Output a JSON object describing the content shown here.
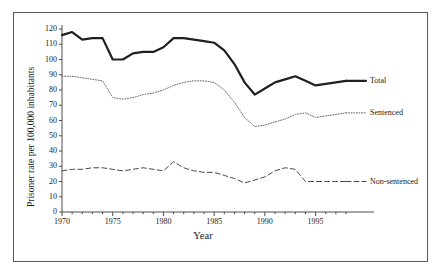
{
  "chart_data": {
    "type": "line",
    "title": "",
    "xlabel": "Year",
    "ylabel": "Prisoner rate per 100,000 inhabitants",
    "xlim": [
      1970,
      1998
    ],
    "ylim": [
      0,
      120
    ],
    "xticks": [
      1970,
      1975,
      1980,
      1985,
      1990,
      1995
    ],
    "yticks": [
      0,
      10,
      20,
      30,
      40,
      50,
      60,
      70,
      80,
      90,
      100,
      110,
      120
    ],
    "grid": false,
    "legend_position": "right-inline",
    "x": [
      1970,
      1971,
      1972,
      1973,
      1974,
      1975,
      1976,
      1977,
      1978,
      1979,
      1980,
      1981,
      1982,
      1983,
      1984,
      1985,
      1986,
      1987,
      1988,
      1989,
      1990,
      1991,
      1992,
      1993,
      1994,
      1995,
      1996,
      1997,
      1998
    ],
    "series": [
      {
        "name": "Total",
        "style": "solid-thick",
        "color": "#1f1f1f",
        "values": [
          116,
          118,
          113,
          114,
          114,
          100,
          100,
          104,
          105,
          105,
          108,
          114,
          114,
          113,
          112,
          111,
          106,
          97,
          85,
          77,
          81,
          85,
          87,
          89,
          86,
          83,
          84,
          85,
          86
        ]
      },
      {
        "name": "Sentenced",
        "style": "dotted",
        "color": "#6b6b6b",
        "values": [
          89,
          89,
          88,
          87,
          86,
          75,
          74,
          75,
          77,
          78,
          80,
          83,
          85,
          86,
          86,
          85,
          80,
          72,
          62,
          56,
          57,
          59,
          61,
          64,
          65,
          62,
          63,
          64,
          65
        ]
      },
      {
        "name": "Non-sentenced",
        "style": "dashed",
        "color": "#4a4a4a",
        "values": [
          27,
          28,
          28,
          29,
          29,
          28,
          27,
          28,
          29,
          28,
          27,
          33,
          29,
          27,
          26,
          26,
          24,
          22,
          19,
          21,
          23,
          27,
          29,
          28,
          20,
          20,
          20,
          20,
          20
        ]
      }
    ],
    "series_labels": [
      {
        "text": "Total",
        "at_year": 1998,
        "at_value": 86
      },
      {
        "text": "Sentenced",
        "at_year": 1998,
        "at_value": 65
      },
      {
        "text": "Non-sentenced",
        "at_year": 1998,
        "at_value": 20
      }
    ]
  }
}
